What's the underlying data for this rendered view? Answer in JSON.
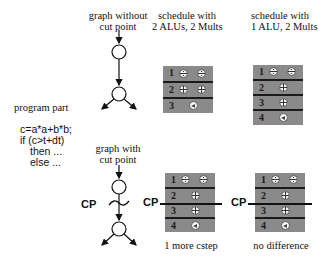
{
  "headers": {
    "graph_without": [
      "graph without",
      "cut point"
    ],
    "graph_with": [
      "graph with",
      "cut point"
    ],
    "schedule_2alu": [
      "schedule with",
      "2 ALUs, 2 Mults"
    ],
    "schedule_1alu": [
      "schedule with",
      "1 ALU, 2 Mults"
    ]
  },
  "program": {
    "title": "program part",
    "lines": [
      "c=a*a+b*b;",
      "if (c>t+dt)",
      "then ...",
      "else ..."
    ]
  },
  "cut_point_label": "CP",
  "schedules": {
    "top_2alu": {
      "rows": [
        {
          "num": "1",
          "ops": [
            "mul",
            "mul"
          ]
        },
        {
          "num": "2",
          "ops": [
            "add",
            "add"
          ]
        },
        {
          "num": "3",
          "ops": [
            "cmp"
          ]
        }
      ]
    },
    "top_1alu": {
      "rows": [
        {
          "num": "1",
          "ops": [
            "mul",
            "mul"
          ]
        },
        {
          "num": "2",
          "ops": [
            "add"
          ]
        },
        {
          "num": "3",
          "ops": [
            "add"
          ]
        },
        {
          "num": "4",
          "ops": [
            "cmp"
          ]
        }
      ]
    },
    "bottom_2alu": {
      "rows": [
        {
          "num": "1",
          "ops": [
            "mul",
            "mul"
          ]
        },
        {
          "num": "2",
          "ops": [
            "add"
          ]
        },
        {
          "num": "3",
          "ops": [
            "add"
          ]
        },
        {
          "num": "4",
          "ops": [
            "cmp"
          ]
        }
      ]
    },
    "bottom_1alu": {
      "rows": [
        {
          "num": "1",
          "ops": [
            "mul",
            "mul"
          ]
        },
        {
          "num": "2",
          "ops": [
            "add"
          ]
        },
        {
          "num": "3",
          "ops": [
            "add"
          ]
        },
        {
          "num": "4",
          "ops": [
            "cmp"
          ]
        }
      ]
    }
  },
  "captions": {
    "bottom_2alu": "1 more cstep",
    "bottom_1alu": "no difference"
  },
  "colors": {
    "schedule_bg": "#8a8a8a",
    "separator": "#1a1a1a",
    "line": "#111111"
  }
}
